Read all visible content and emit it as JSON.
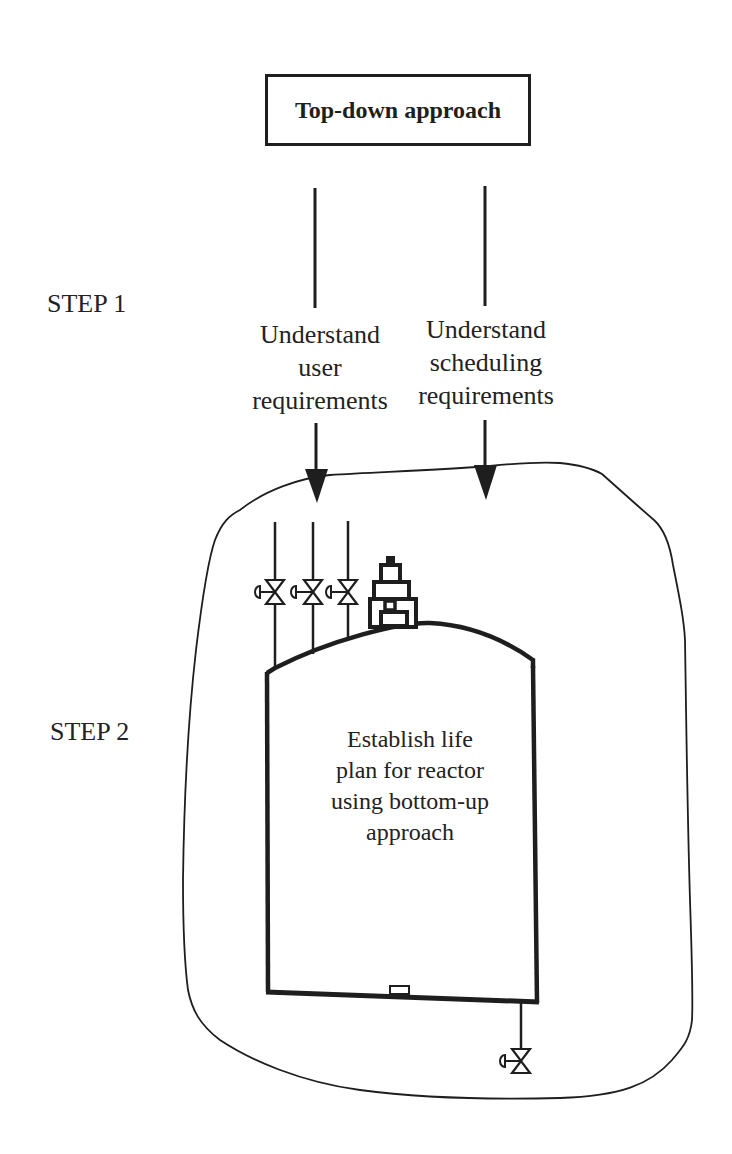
{
  "diagram": {
    "title": "Top-down approach",
    "steps": [
      {
        "label": "STEP 1"
      },
      {
        "label": "STEP 2"
      }
    ],
    "requirements": [
      {
        "lines": [
          "Understand",
          "user",
          "requirements"
        ]
      },
      {
        "lines": [
          "Understand",
          "scheduling",
          "requirements"
        ]
      }
    ],
    "vessel": {
      "lines": [
        "Establish life",
        "plan for reactor",
        "using bottom-up",
        "approach"
      ]
    },
    "components": {
      "inlet_valves": 3,
      "outlet_valves": 1,
      "top_instrument": "agitator-drive",
      "bottom_nozzle": "manway"
    },
    "colors": {
      "ink": "#1e1e1e",
      "background": "#ffffff"
    }
  }
}
